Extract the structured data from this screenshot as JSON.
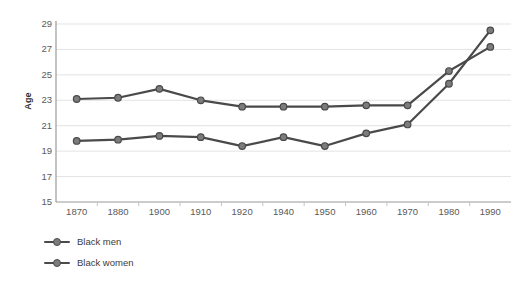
{
  "chart_data": {
    "type": "line",
    "title": "",
    "subtitle": "",
    "xlabel": "",
    "ylabel": "Age",
    "categories": [
      "1870",
      "1880",
      "1900",
      "1910",
      "1920",
      "1940",
      "1950",
      "1960",
      "1970",
      "1980",
      "1990"
    ],
    "yticks": [
      "15",
      "17",
      "19",
      "21",
      "23",
      "25",
      "27",
      "29"
    ],
    "ylim": [
      15,
      29
    ],
    "grid": true,
    "legend_position": "bottom-left",
    "series": [
      {
        "name": "Black men",
        "color": "#4a4a4a",
        "values": [
          23.1,
          23.2,
          23.9,
          23.0,
          22.5,
          22.5,
          22.5,
          22.6,
          22.6,
          25.3,
          27.2
        ]
      },
      {
        "name": "Black women",
        "color": "#4a4a4a",
        "values": [
          19.8,
          19.9,
          20.2,
          20.1,
          19.4,
          20.1,
          19.4,
          20.4,
          21.1,
          24.3,
          28.5
        ]
      }
    ]
  },
  "style": {
    "line_color": "#4a4a4a",
    "marker_fill": "#7c7c7c",
    "marker_stroke": "#4a4a4a",
    "grid_color": "#e3e3e3",
    "axis_color": "#bdbdbd",
    "tick_text_color": "#5a5a5a",
    "background": "#ffffff"
  }
}
